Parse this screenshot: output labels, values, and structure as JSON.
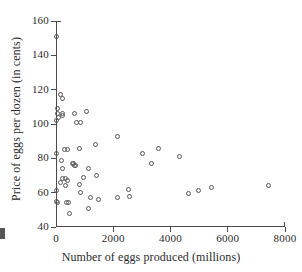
{
  "figure": {
    "background_color": "#ffffff",
    "ink_color": "#2b2b2b",
    "axis_color": "#4a4a4a",
    "marker_color": "#58585c"
  },
  "chart_data": {
    "type": "scatter",
    "title": "",
    "subtitle": "",
    "xlabel": "Number of eggs produced (millions)",
    "ylabel": "Price of eggs per dozen (in cents)",
    "xlim": [
      0,
      8000
    ],
    "ylim": [
      40,
      160
    ],
    "xticks": [
      0,
      2000,
      4000,
      6000,
      8000
    ],
    "yticks": [
      40,
      60,
      80,
      100,
      120,
      140,
      160
    ],
    "xticklabels": [
      "0",
      "2000",
      "4000",
      "6000",
      "8000"
    ],
    "yticklabels": [
      "40",
      "60",
      "80",
      "100",
      "120",
      "140",
      "160"
    ],
    "grid": false,
    "legend": false,
    "legend_position": "none",
    "marker": "open-circle",
    "series": [
      {
        "name": "States",
        "points": [
          [
            30,
            151
          ],
          [
            140,
            117
          ],
          [
            215,
            115
          ],
          [
            40,
            109
          ],
          [
            60,
            106
          ],
          [
            70,
            104
          ],
          [
            30,
            102
          ],
          [
            210,
            106
          ],
          [
            235,
            105
          ],
          [
            640,
            106
          ],
          [
            1055,
            107
          ],
          [
            700,
            101
          ],
          [
            840,
            101
          ],
          [
            2160,
            93
          ],
          [
            1370,
            88
          ],
          [
            830,
            86
          ],
          [
            3580,
            86
          ],
          [
            280,
            85
          ],
          [
            390,
            85
          ],
          [
            30,
            83
          ],
          [
            3020,
            83
          ],
          [
            4310,
            81
          ],
          [
            175,
            79
          ],
          [
            3340,
            77
          ],
          [
            560,
            77
          ],
          [
            600,
            77
          ],
          [
            640,
            76
          ],
          [
            675,
            76
          ],
          [
            1140,
            74
          ],
          [
            240,
            74
          ],
          [
            1430,
            70
          ],
          [
            945,
            69
          ],
          [
            215,
            68
          ],
          [
            325,
            68
          ],
          [
            390,
            67
          ],
          [
            140,
            66
          ],
          [
            820,
            65
          ],
          [
            345,
            64
          ],
          [
            7440,
            64
          ],
          [
            5430,
            63
          ],
          [
            2545,
            62
          ],
          [
            4990,
            61
          ],
          [
            30,
            61
          ],
          [
            870,
            60
          ],
          [
            4630,
            59.5
          ],
          [
            2555,
            58
          ],
          [
            2150,
            57
          ],
          [
            1200,
            57
          ],
          [
            1480,
            56
          ],
          [
            30,
            55
          ],
          [
            40,
            54
          ],
          [
            350,
            54
          ],
          [
            420,
            54
          ],
          [
            1140,
            51
          ],
          [
            460,
            48
          ]
        ]
      }
    ]
  }
}
